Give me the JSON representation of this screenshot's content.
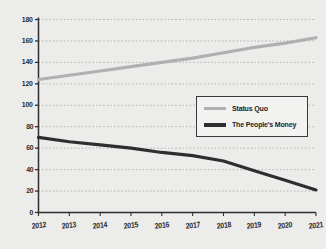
{
  "chart_data": {
    "type": "line",
    "title": "",
    "xlabel": "",
    "ylabel": "",
    "categories": [
      "2012",
      "2013",
      "2014",
      "2015",
      "2016",
      "2017",
      "2018",
      "2019",
      "2020",
      "2021"
    ],
    "x": [
      2012,
      2013,
      2014,
      2015,
      2016,
      2017,
      2018,
      2019,
      2020,
      2021
    ],
    "ylim": [
      0,
      180
    ],
    "yticks": [
      0,
      20,
      40,
      60,
      80,
      100,
      120,
      140,
      160,
      180
    ],
    "ytick_labels": [
      "0",
      "20",
      "40",
      "60",
      "80",
      "100",
      "120",
      "140",
      "160",
      "180"
    ],
    "grid": true,
    "grid_style": "dotted-horizontal",
    "legend_position": "center-right",
    "background_color": "#ececeb",
    "series": [
      {
        "name": "Status Quo",
        "color": "#b0b0b0",
        "values": [
          124,
          128,
          132,
          136,
          140,
          144,
          149,
          154,
          158,
          163
        ]
      },
      {
        "name": "The People's Money",
        "color": "#2e2e2e",
        "values": [
          70,
          66,
          63,
          60,
          56,
          53,
          48,
          39,
          30,
          21
        ]
      }
    ]
  },
  "legend": {
    "entries": [
      {
        "label": "Status Quo"
      },
      {
        "label": "The People's Money"
      }
    ]
  }
}
